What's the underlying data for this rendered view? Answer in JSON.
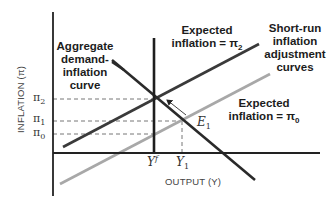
{
  "diagram": {
    "y_axis_label": "INFLATION (π)",
    "x_axis_label": "OUTPUT (Y)",
    "y_ticks": [
      {
        "base": "π",
        "sub": "2"
      },
      {
        "base": "π",
        "sub": "1"
      },
      {
        "base": "π",
        "sub": "0"
      }
    ],
    "x_ticks": [
      {
        "base": "Y",
        "sup": "f"
      },
      {
        "base": "Y",
        "sub": "1"
      }
    ],
    "labels": {
      "ad_curve": [
        "Aggregate",
        "demand-",
        "inflation",
        "curve"
      ],
      "expected_pi2_line1": "Expected",
      "expected_pi2_line2": "inflation = π",
      "expected_pi2_sub": "2",
      "sria": [
        "Short-run",
        "inflation",
        "adjustment",
        "curves"
      ],
      "expected_pi0_line1": "Expected",
      "expected_pi0_line2": "inflation = π",
      "expected_pi0_sub": "0",
      "point_e1": "E",
      "point_e1_sub": "1"
    },
    "colors": {
      "dark_line": "#333333",
      "light_line": "#a8a8a8",
      "axis": "#222222",
      "dashed": "#777777"
    }
  }
}
